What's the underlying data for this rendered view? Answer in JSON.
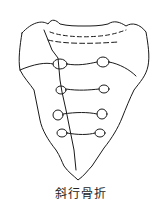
{
  "figure": {
    "caption": "斜行骨折"
  }
}
